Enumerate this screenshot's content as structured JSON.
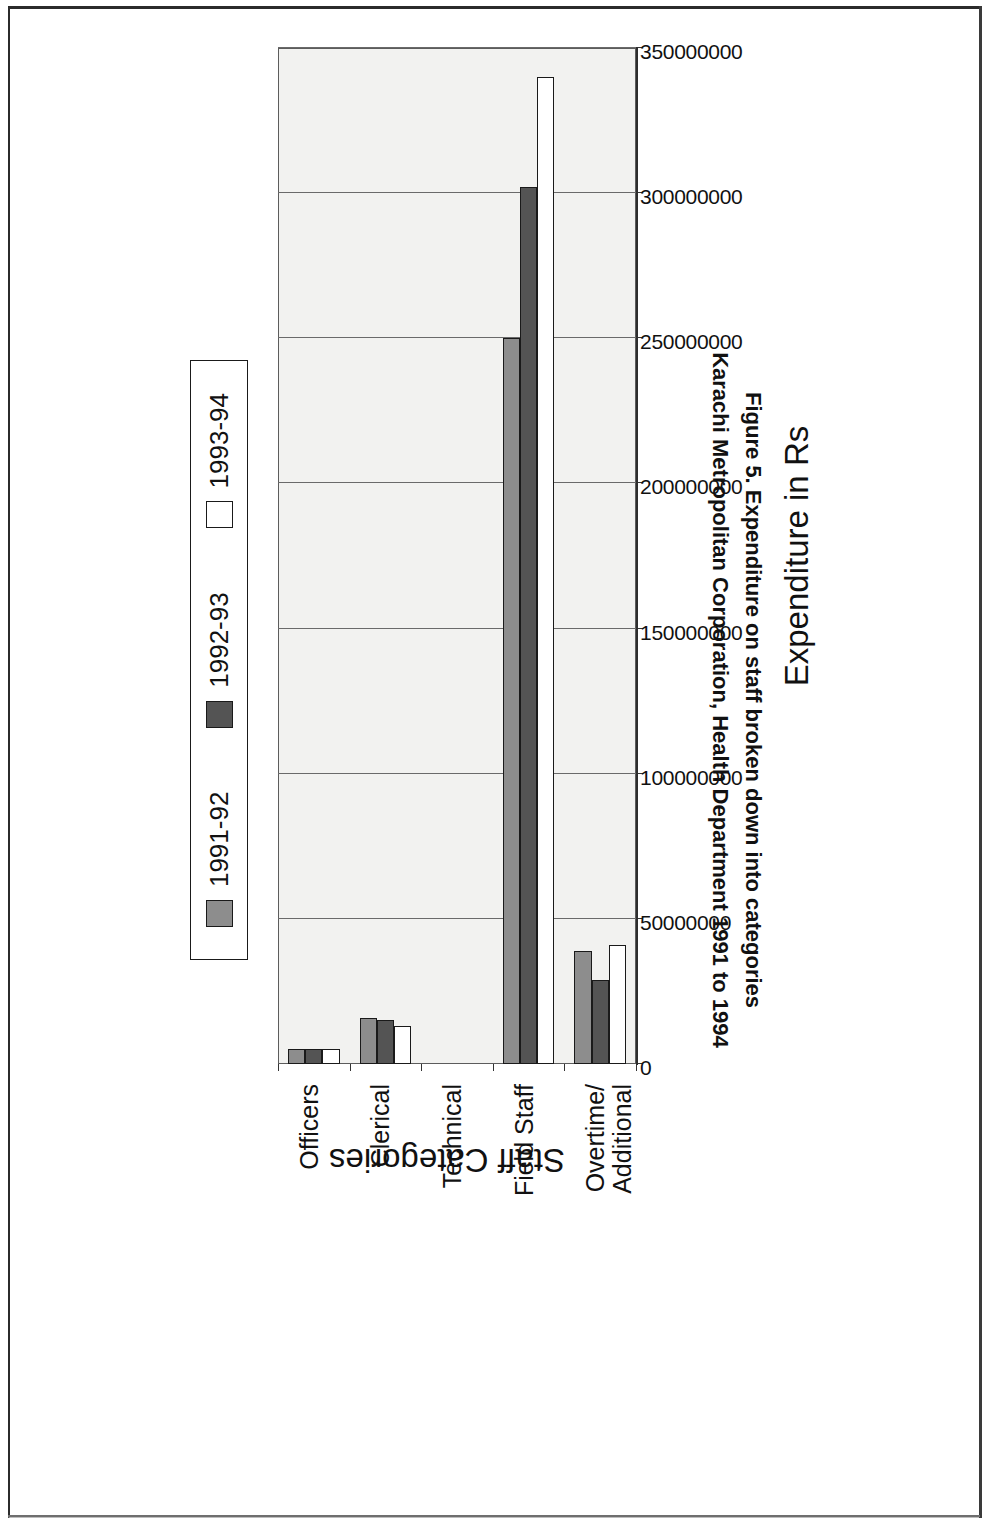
{
  "figure": {
    "caption_line1": "Figure 5. Expenditure on staff broken down into categories",
    "caption_line2": "Karachi Metropolitan Corporation, Health Department 1991 to 1994"
  },
  "axes": {
    "value_title": "Expenditure in Rs",
    "category_title": "Staff Categories"
  },
  "legend": {
    "items": [
      {
        "label": "1991-92",
        "color": "#8d8d8d"
      },
      {
        "label": "1992-93",
        "color": "#545454"
      },
      {
        "label": "1993-94",
        "color": "#ffffff"
      }
    ]
  },
  "chart_data": {
    "type": "bar",
    "orientation": "vertical",
    "title": "Figure 5. Expenditure on staff broken down into categories",
    "subtitle": "Karachi Metropolitan Corporation, Health Department 1991 to 1994",
    "xlabel": "Staff Categories",
    "ylabel": "Expenditure in Rs",
    "categories": [
      "Officers",
      "Clerical",
      "Technical",
      "Field Staff",
      "Overtime/\nAdditional"
    ],
    "category_labels_flat": [
      "Officers",
      "Clerical",
      "Technical",
      "Field Staff",
      "Overtime/Additional"
    ],
    "series": [
      {
        "name": "1991-92",
        "color": "#8d8d8d",
        "values": [
          5000000,
          16000000,
          0,
          250000000,
          39000000
        ]
      },
      {
        "name": "1992-93",
        "color": "#545454",
        "values": [
          5000000,
          15000000,
          0,
          302000000,
          29000000
        ]
      },
      {
        "name": "1993-94",
        "color": "#ffffff",
        "values": [
          5000000,
          13000000,
          0,
          340000000,
          41000000
        ]
      }
    ],
    "ylim": [
      0,
      350000000
    ],
    "ytick_values": [
      0,
      50000000,
      100000000,
      150000000,
      200000000,
      250000000,
      300000000,
      350000000
    ],
    "ytick_labels": [
      "0",
      "50000000",
      "100000000",
      "150000000",
      "200000000",
      "250000000",
      "300000000",
      "350000000"
    ],
    "grid": true,
    "legend_position": "top"
  }
}
